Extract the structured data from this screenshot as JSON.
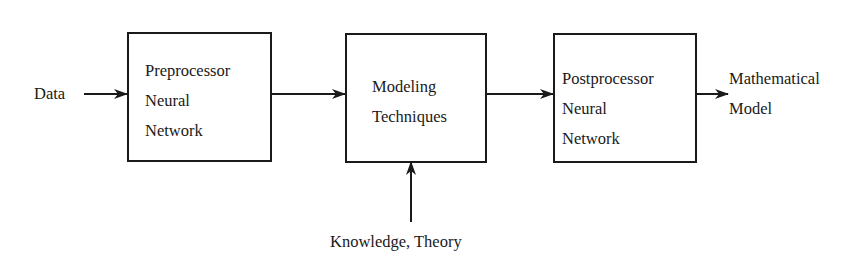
{
  "diagram": {
    "type": "block-flow",
    "input_label": "Data",
    "blocks": [
      {
        "id": "preprocessor",
        "lines": [
          "Preprocessor",
          "Neural",
          "Network"
        ]
      },
      {
        "id": "modeling",
        "lines": [
          "Modeling",
          "Techniques"
        ]
      },
      {
        "id": "postprocessor",
        "lines": [
          "Postprocessor",
          "Neural",
          "Network"
        ]
      }
    ],
    "output_label": {
      "lines": [
        "Mathematical",
        "Model"
      ]
    },
    "side_input_label": "Knowledge, Theory",
    "edges": [
      {
        "from": "Data",
        "to": "preprocessor"
      },
      {
        "from": "preprocessor",
        "to": "modeling"
      },
      {
        "from": "modeling",
        "to": "postprocessor"
      },
      {
        "from": "postprocessor",
        "to": "Mathematical Model"
      },
      {
        "from": "Knowledge, Theory",
        "to": "modeling"
      }
    ],
    "colors": {
      "stroke": "#1a1a1a",
      "background": "#ffffff"
    }
  }
}
